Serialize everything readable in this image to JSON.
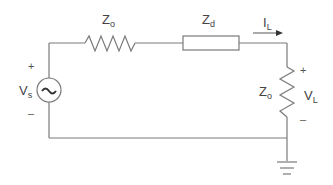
{
  "diagram": {
    "type": "circuit",
    "components": {
      "source": {
        "label": "V",
        "subscript": "s",
        "symbol": "~",
        "plus": "+",
        "minus": "–"
      },
      "series_impedance_1": {
        "label": "Z",
        "subscript": "o"
      },
      "series_impedance_2": {
        "label": "Z",
        "subscript": "d"
      },
      "current": {
        "label": "I",
        "subscript": "L"
      },
      "load_impedance": {
        "label": "Z",
        "subscript": "o"
      },
      "load_voltage": {
        "label": "V",
        "subscript": "L",
        "plus": "+",
        "minus": "–"
      }
    },
    "colors": {
      "wire": "#7a7a7a",
      "text": "#444444"
    }
  }
}
